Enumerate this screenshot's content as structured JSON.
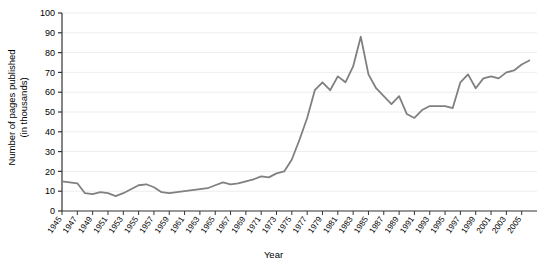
{
  "chart_data": {
    "type": "line",
    "title": "",
    "xlabel": "Year",
    "ylabel_line1": "Number of pages published",
    "ylabel_line2": "(in thousands)",
    "ylim": [
      0,
      100
    ],
    "yticks": [
      0,
      10,
      20,
      30,
      40,
      50,
      60,
      70,
      80,
      90,
      100
    ],
    "xlim": [
      1945,
      2007
    ],
    "xticks": [
      1945,
      1947,
      1949,
      1951,
      1953,
      1955,
      1957,
      1959,
      1961,
      1963,
      1965,
      1967,
      1969,
      1971,
      1973,
      1975,
      1977,
      1979,
      1981,
      1983,
      1985,
      1987,
      1989,
      1991,
      1993,
      1995,
      1997,
      1999,
      2001,
      2003,
      2005
    ],
    "grid": "horizontal",
    "legend": "none",
    "line_color": "#808080",
    "x": [
      1945,
      1946,
      1947,
      1948,
      1949,
      1950,
      1951,
      1952,
      1953,
      1954,
      1955,
      1956,
      1957,
      1958,
      1959,
      1960,
      1961,
      1962,
      1963,
      1964,
      1965,
      1966,
      1967,
      1968,
      1969,
      1970,
      1971,
      1972,
      1973,
      1974,
      1975,
      1976,
      1977,
      1978,
      1979,
      1980,
      1981,
      1982,
      1983,
      1984,
      1985,
      1986,
      1987,
      1988,
      1989,
      1990,
      1991,
      1992,
      1993,
      1994,
      1995,
      1996,
      1997,
      1998,
      1999,
      2000,
      2001,
      2002,
      2003,
      2004,
      2005,
      2006
    ],
    "values": [
      15,
      14.5,
      14,
      9,
      8.5,
      9.5,
      9,
      7.5,
      9,
      11,
      13,
      13.5,
      12,
      9.5,
      9,
      9.5,
      10,
      10.5,
      11,
      11.5,
      13,
      14.5,
      13.5,
      14,
      15,
      16,
      17.5,
      17,
      19,
      20,
      26,
      36,
      47,
      61,
      65,
      61,
      68,
      65,
      73,
      88,
      69,
      62,
      58,
      54,
      58,
      49,
      47,
      51,
      53,
      53,
      53,
      52,
      65,
      69,
      62,
      67,
      68,
      67,
      70,
      71,
      74,
      76
    ],
    "series_name": "Pages published"
  },
  "axes": {
    "y_tick_labels": [
      "0",
      "10",
      "20",
      "30",
      "40",
      "50",
      "60",
      "70",
      "80",
      "90",
      "100"
    ],
    "x_tick_labels": [
      "1945",
      "1947",
      "1949",
      "1951",
      "1953",
      "1955",
      "1957",
      "1959",
      "1961",
      "1963",
      "1965",
      "1967",
      "1969",
      "1971",
      "1973",
      "1975",
      "1977",
      "1979",
      "1981",
      "1983",
      "1985",
      "1987",
      "1989",
      "1991",
      "1993",
      "1995",
      "1997",
      "1999",
      "2001",
      "2003",
      "2005"
    ]
  }
}
